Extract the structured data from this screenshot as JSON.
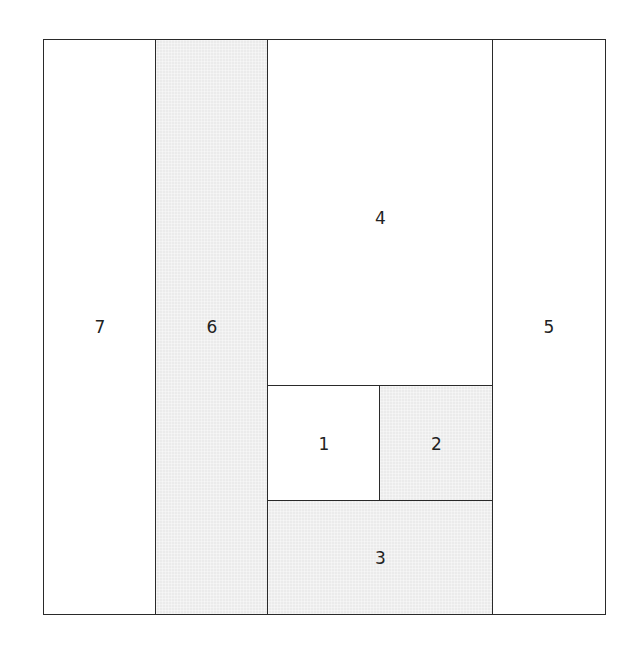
{
  "diagram": {
    "type": "rectangle-partition",
    "shaded_color": "#ebebeb",
    "unshaded_color": "#ffffff",
    "border_color": "#2a2a2a",
    "regions": [
      {
        "label": "1",
        "shaded": false,
        "position": "center-lower-left, between 4 and 3"
      },
      {
        "label": "2",
        "shaded": true,
        "position": "center-lower-right, between 4 and 3"
      },
      {
        "label": "3",
        "shaded": true,
        "position": "center-bottom"
      },
      {
        "label": "4",
        "shaded": false,
        "position": "center-top"
      },
      {
        "label": "5",
        "shaded": false,
        "position": "right column"
      },
      {
        "label": "6",
        "shaded": true,
        "position": "second column from left"
      },
      {
        "label": "7",
        "shaded": false,
        "position": "left column"
      }
    ],
    "labels": {
      "r1": "1",
      "r2": "2",
      "r3": "3",
      "r4": "4",
      "r5": "5",
      "r6": "6",
      "r7": "7"
    }
  }
}
